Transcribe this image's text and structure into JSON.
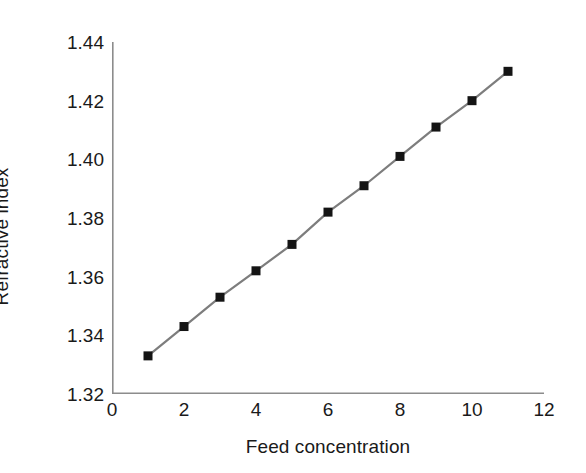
{
  "chart_data": {
    "type": "line",
    "title": "",
    "subtitle": "",
    "xlabel": "Feed concentration",
    "ylabel": "Refractive index",
    "x": [
      1,
      2,
      3,
      4,
      5,
      6,
      7,
      8,
      9,
      10,
      11
    ],
    "values": [
      1.333,
      1.343,
      1.353,
      1.362,
      1.371,
      1.382,
      1.391,
      1.401,
      1.411,
      1.42,
      1.43
    ],
    "series": [
      {
        "name": "Refractive index",
        "values": [
          1.333,
          1.343,
          1.353,
          1.362,
          1.371,
          1.382,
          1.391,
          1.401,
          1.411,
          1.42,
          1.43
        ]
      }
    ],
    "xlim": [
      0,
      12
    ],
    "ylim": [
      1.32,
      1.44
    ],
    "x_ticks": [
      0,
      2,
      4,
      6,
      8,
      10,
      12
    ],
    "x_tick_labels": [
      "0",
      "2",
      "4",
      "6",
      "8",
      "10",
      "12"
    ],
    "x_minor_ticks": [
      1,
      3,
      5,
      7,
      9,
      11
    ],
    "y_ticks": [
      1.32,
      1.34,
      1.36,
      1.38,
      1.4,
      1.42,
      1.44
    ],
    "y_tick_labels": [
      "1.32",
      "1.34",
      "1.36",
      "1.38",
      "1.40",
      "1.42",
      "1.44"
    ],
    "y_minor_ticks": [
      1.33,
      1.35,
      1.37,
      1.39,
      1.41,
      1.43
    ],
    "grid": false,
    "legend": "none",
    "marker": "square",
    "marker_color": "#141414",
    "line_color": "#7d7d7d",
    "axis_color": "#8c8c8c",
    "background": "#ffffff"
  }
}
